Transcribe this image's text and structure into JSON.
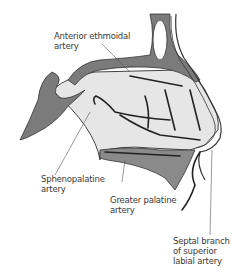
{
  "diagram": {
    "colors": {
      "bone": "#7b7b7b",
      "cartilage_tissue": "#e4e4e4",
      "artery": "#2a2a2a",
      "outline": "#3a3a3a",
      "label_text": "#3a3a3a",
      "background": "#ffffff"
    },
    "labels": [
      {
        "id": "anterior-ethmoidal",
        "lines": [
          "Anterior ethmoidal",
          "artery"
        ]
      },
      {
        "id": "sphenopalatine",
        "lines": [
          "Sphenopalatine",
          "artery"
        ]
      },
      {
        "id": "greater-palatine",
        "lines": [
          "Greater palatine",
          "artery"
        ]
      },
      {
        "id": "septal-branch",
        "lines": [
          "Septal branch",
          "of superior",
          "labial artery"
        ]
      }
    ]
  }
}
